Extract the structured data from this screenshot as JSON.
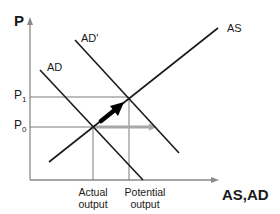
{
  "diagram": {
    "y_axis_label": "P",
    "x_axis_label": "AS,AD",
    "curves": [
      {
        "name": "AD",
        "label": "AD"
      },
      {
        "name": "AD'",
        "label": "AD'"
      },
      {
        "name": "AS",
        "label": "AS"
      }
    ],
    "price_levels": [
      {
        "label": "P",
        "sub": "1"
      },
      {
        "label": "P",
        "sub": "0"
      }
    ],
    "output_levels": [
      {
        "line1": "Actual",
        "line2": "output"
      },
      {
        "line1": "Potential",
        "line2": "output"
      }
    ],
    "arrows": [
      {
        "name": "shift-arrow",
        "description": "black arrow from initial to new equilibrium"
      },
      {
        "name": "output-gap-arrow",
        "description": "gray arrow from actual to potential output"
      }
    ],
    "colors": {
      "curve": "#1a1a1a",
      "axis": "#8a8a8a",
      "guide": "#7a7a7a",
      "gray_arrow": "#a8a8a8"
    }
  }
}
